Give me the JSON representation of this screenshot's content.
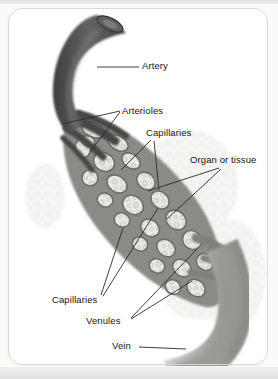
{
  "figure": {
    "type": "anatomical-diagram",
    "labels": {
      "artery": "Artery",
      "arterioles": "Arterioles",
      "capillaries_top": "Capillaries",
      "organ_or_tissue": "Organ or tissue",
      "capillaries_bottom": "Capillaries",
      "venules": "Venules",
      "vein": "Vein"
    },
    "colors": {
      "ink": "#161616",
      "leader_line": "#2a2a2a",
      "artery_dark": "#4a4a4a",
      "capillary_wall": "#8a8a86",
      "tissue_light": "#e9e9e5",
      "vein_gray": "#b2b2ae",
      "frame_border": "#d8d8d4",
      "page_edge": "#e0e0de",
      "background": "#ffffff"
    }
  }
}
